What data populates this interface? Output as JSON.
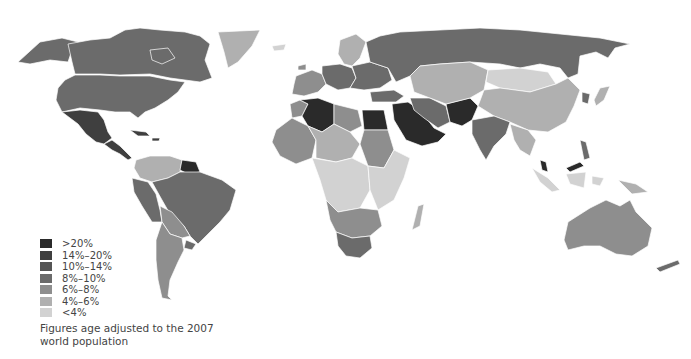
{
  "legend": {
    "items": [
      {
        "label": ">20%",
        "color": "#2a2a2a"
      },
      {
        "label": "14%–20%",
        "color": "#3f3f3f"
      },
      {
        "label": "10%–14%",
        "color": "#555555"
      },
      {
        "label": "8%–10%",
        "color": "#6b6b6b"
      },
      {
        "label": "6%–8%",
        "color": "#8e8e8e"
      },
      {
        "label": "4%–6%",
        "color": "#b0b0b0"
      },
      {
        "label": "<4%",
        "color": "#d2d2d2"
      }
    ]
  },
  "note": {
    "line1": "Figures age adjusted to the 2007",
    "line2": "world population"
  },
  "regions": {
    "alaska": "#6b6b6b",
    "canada": "#6b6b6b",
    "usa": "#6b6b6b",
    "greenland": "#b0b0b0",
    "iceland": "#d2d2d2",
    "mexico": "#3f3f3f",
    "central_america": "#3f3f3f",
    "caribbean": "#3f3f3f",
    "colombia_venezuela": "#b0b0b0",
    "guianas": "#2a2a2a",
    "peru_ecuador": "#6b6b6b",
    "brazil": "#6b6b6b",
    "bolivia_paraguay": "#8e8e8e",
    "argentina_chile": "#8e8e8e",
    "uruguay": "#6b6b6b",
    "scandinavia": "#b0b0b0",
    "western_europe": "#8e8e8e",
    "central_europe": "#6b6b6b",
    "eastern_europe": "#6b6b6b",
    "russia": "#6b6b6b",
    "morocco": "#8e8e8e",
    "algeria": "#2a2a2a",
    "libya": "#8e8e8e",
    "egypt": "#2a2a2a",
    "west_africa": "#8e8e8e",
    "sahel": "#b0b0b0",
    "sudan": "#8e8e8e",
    "central_africa": "#d2d2d2",
    "east_africa": "#d2d2d2",
    "southern_africa": "#8e8e8e",
    "south_africa": "#6b6b6b",
    "madagascar": "#b0b0b0",
    "turkey": "#6b6b6b",
    "arabia": "#2a2a2a",
    "iran": "#6b6b6b",
    "afghan_pakistan": "#2a2a2a",
    "central_asia": "#b0b0b0",
    "mongolia": "#d2d2d2",
    "china": "#b0b0b0",
    "india": "#6b6b6b",
    "southeast_asia": "#b0b0b0",
    "japan": "#b0b0b0",
    "korea": "#6b6b6b",
    "malaysia": "#2a2a2a",
    "indonesia": "#d2d2d2",
    "philippines": "#6b6b6b",
    "png": "#b0b0b0",
    "australia": "#8e8e8e",
    "new_zealand": "#6b6b6b"
  }
}
